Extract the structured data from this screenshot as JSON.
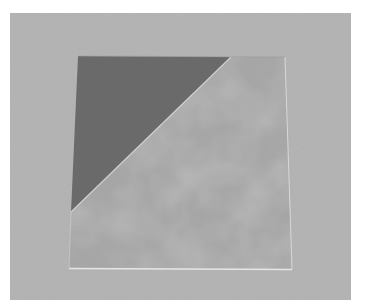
{
  "image": {
    "description": "Grayscale photograph of a square sheet on a gray backdrop, split diagonally into a dark upper-left triangle and a mottled lighter lower-right region",
    "colors": {
      "page_border": "#ffffff",
      "backdrop": "#b5b5b5",
      "dark_triangle": "#6c6c6c",
      "mottled_light": "#a6a6a6",
      "mottled_dark": "#8a8a8a",
      "edge_highlight": "#d8d8d8"
    },
    "geometry": {
      "backdrop": {
        "x": 10,
        "y": 13,
        "width": 341,
        "height": 287
      },
      "square": [
        [
          78,
          56
        ],
        [
          285,
          57
        ],
        [
          292,
          269
        ],
        [
          69,
          268
        ]
      ],
      "diagonal": [
        [
          231,
          57
        ],
        [
          71,
          212
        ]
      ]
    }
  }
}
